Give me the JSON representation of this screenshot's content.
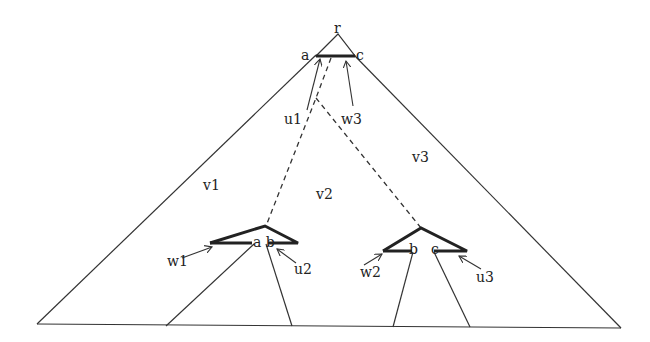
{
  "diagram": {
    "type": "tree-partition",
    "colors": {
      "stroke": "#333333",
      "thick_stroke": "#222222",
      "background": "#ffffff"
    },
    "top_triangle": {
      "root_label": "r",
      "left_label": "a",
      "right_label": "c",
      "arrows": [
        {
          "label": "u1"
        },
        {
          "label": "w3"
        }
      ]
    },
    "regions": [
      {
        "label": "v1"
      },
      {
        "label": "v2"
      },
      {
        "label": "v3"
      }
    ],
    "left_subtree": {
      "node_labels": "a b",
      "arrows": [
        {
          "label": "w1"
        },
        {
          "label": "u2"
        }
      ]
    },
    "right_subtree": {
      "left_label": "b",
      "right_label": "c",
      "arrows": [
        {
          "label": "w2"
        },
        {
          "label": "u3"
        }
      ]
    }
  }
}
